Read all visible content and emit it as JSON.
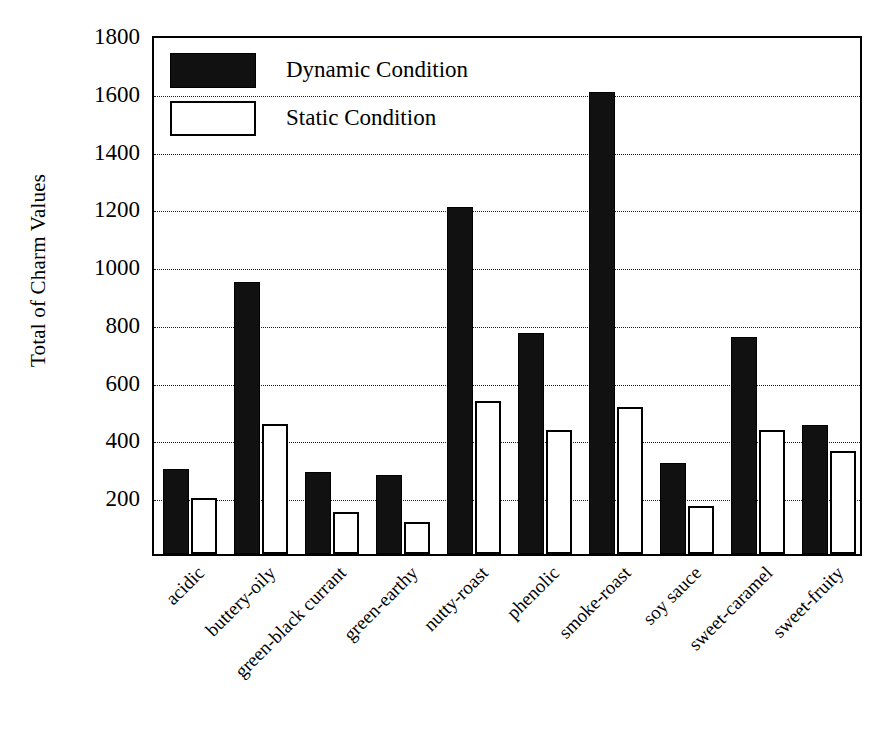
{
  "chart_data": {
    "type": "bar",
    "title": "",
    "xlabel": "",
    "ylabel": "Total of Charm Values",
    "ylim": [
      0,
      1800
    ],
    "ytick_step": 200,
    "yticks": [
      200,
      400,
      600,
      800,
      1000,
      1200,
      1400,
      1600,
      1800
    ],
    "grid": true,
    "grid_axis": "y",
    "legend_position": "top-left-inside",
    "categories": [
      "acidic",
      "buttery-oily",
      "green-black currant",
      "green-earthy",
      "nutty-roast",
      "phenolic",
      "smoke-roast",
      "soy sauce",
      "sweet-caramel",
      "sweet-fruity"
    ],
    "series": [
      {
        "name": "Dynamic Condition",
        "color": "#111111",
        "fill": "solid-black",
        "values": [
          295,
          940,
          285,
          275,
          1200,
          765,
          1600,
          315,
          750,
          445
        ]
      },
      {
        "name": "Static Condition",
        "color": "#ffffff",
        "fill": "white-outlined",
        "values": [
          195,
          450,
          145,
          110,
          530,
          428,
          510,
          165,
          430,
          355
        ]
      }
    ]
  },
  "legend": {
    "items": [
      {
        "label": "Dynamic Condition",
        "style": "dynamic"
      },
      {
        "label": "Static Condition",
        "style": "static"
      }
    ]
  },
  "axes": {
    "y_title": "Total of Charm Values"
  },
  "caption": {
    "text": ""
  }
}
